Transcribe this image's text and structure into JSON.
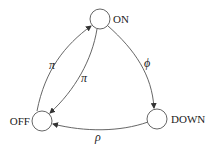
{
  "diagram": {
    "type": "state-transition",
    "nodes": [
      {
        "id": "on",
        "label": "ON"
      },
      {
        "id": "off",
        "label": "OFF"
      },
      {
        "id": "down",
        "label": "DOWN"
      }
    ],
    "edges": [
      {
        "from": "off",
        "to": "on",
        "label": "π"
      },
      {
        "from": "on",
        "to": "off",
        "label": "π"
      },
      {
        "from": "on",
        "to": "down",
        "label": "ϕ"
      },
      {
        "from": "down",
        "to": "off",
        "label": "ρ"
      }
    ]
  }
}
